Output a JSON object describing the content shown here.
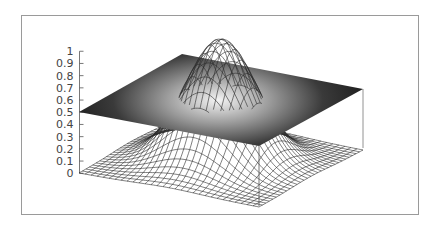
{
  "chart_data": {
    "type": "surface3d",
    "title": "",
    "xlabel": "",
    "ylabel": "",
    "zlabel": "",
    "zlim": [
      0,
      1
    ],
    "z_ticks": [
      "0",
      "0.1",
      "0.2",
      "0.3",
      "0.4",
      "0.5",
      "0.6",
      "0.7",
      "0.8",
      "0.9",
      "1"
    ],
    "x_range": [
      -2,
      2
    ],
    "y_range": [
      -2,
      2
    ],
    "grid": false,
    "legend": null,
    "series": [
      {
        "name": "mesh surface",
        "style": "wireframe",
        "function": "exp(-(x^2+y^2))",
        "grid_lines": 30,
        "color": "#333333"
      },
      {
        "name": "plane",
        "style": "shaded surface",
        "function": "0.5",
        "shading": "grayscale, light at center, dark at edges"
      }
    ],
    "projection": {
      "center_screen_z0": [
        221,
        161.25
      ],
      "ex": [
        45,
        8.5
      ],
      "ey": [
        25.75,
        -14.5
      ],
      "ez": [
        0,
        -122
      ]
    }
  },
  "colors": {
    "frame": "#9a9a9a",
    "mesh": "#2a2a2a",
    "axis": "#555555",
    "plane_dark": "#1e1e1e",
    "plane_light": "#f4f4f4"
  }
}
